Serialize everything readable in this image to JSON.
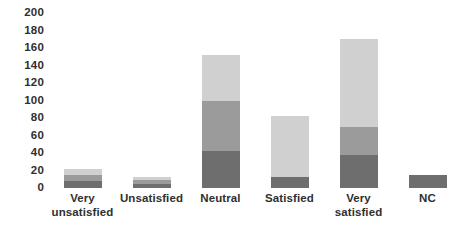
{
  "chart_data": {
    "type": "bar",
    "title": "",
    "subtitle": "",
    "xlabel": "",
    "ylabel": "",
    "ylim": [
      0,
      200
    ],
    "grid": false,
    "legend": "none",
    "stacked": true,
    "categories": [
      "Very unsatisfied",
      "Unsatisfied",
      "Neutral",
      "Satisfied",
      "Very satisfied",
      "NC"
    ],
    "category_lines": [
      [
        "Very",
        "unsatisfied"
      ],
      [
        "Unsatisfied",
        ""
      ],
      [
        "Neutral",
        ""
      ],
      [
        "Satisfied",
        ""
      ],
      [
        "Very",
        "satisfied"
      ],
      [
        "NC",
        ""
      ]
    ],
    "ytick_labels": [
      "200",
      "180",
      "160",
      "140",
      "120",
      "100",
      "80",
      "60",
      "40",
      "20",
      "0"
    ],
    "ytick_values": [
      200,
      180,
      160,
      140,
      120,
      100,
      80,
      60,
      40,
      20,
      0
    ],
    "series": [
      {
        "name": "segment-bottom-dark",
        "color": "#6e6e6e",
        "values": [
          8,
          5,
          42,
          13,
          38,
          15
        ]
      },
      {
        "name": "segment-middle-mid",
        "color": "#9b9b9b",
        "values": [
          7,
          4,
          58,
          0,
          32,
          0
        ]
      },
      {
        "name": "segment-top-light",
        "color": "#d0d0d0",
        "values": [
          7,
          4,
          52,
          69,
          100,
          0
        ]
      }
    ],
    "totals": [
      22,
      13,
      152,
      82,
      170,
      15
    ],
    "colors": {
      "light": "#d0d0d0",
      "medium": "#9b9b9b",
      "dark": "#6e6e6e",
      "text": "#2f2f2f",
      "background": "#ffffff"
    }
  }
}
